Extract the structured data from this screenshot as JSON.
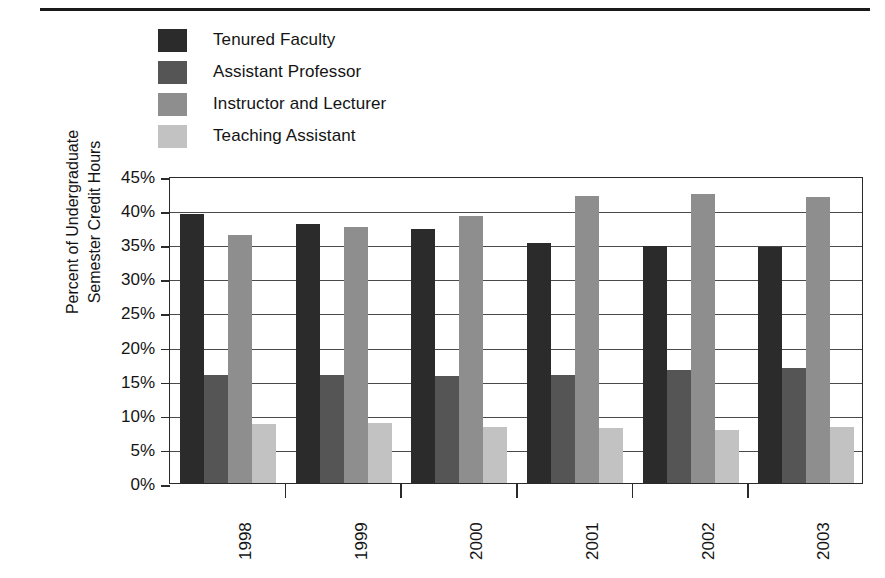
{
  "chart_data": {
    "type": "bar",
    "title": "",
    "xlabel": "",
    "ylabel": "Percent of Undergraduate Semester Credit Hours",
    "ylabel_line1": "Percent of Undergraduate",
    "ylabel_line2": "Semester Credit Hours",
    "categories": [
      "1998",
      "1999",
      "2000",
      "2001",
      "2002",
      "2003"
    ],
    "ylim": [
      0,
      45
    ],
    "ytick_labels": [
      "45%",
      "40%",
      "35%",
      "30%",
      "25%",
      "20%",
      "15%",
      "10%",
      "5%",
      "0%"
    ],
    "ytick_values": [
      45,
      40,
      35,
      30,
      25,
      20,
      15,
      10,
      5,
      0
    ],
    "grid": true,
    "legend_position": "top-left",
    "series": [
      {
        "name": "Tenured Faculty",
        "color": "#2b2b2b",
        "values": [
          39.4,
          37.9,
          37.3,
          35.2,
          34.7,
          34.6
        ]
      },
      {
        "name": "Assistant Professor",
        "color": "#555555",
        "values": [
          15.9,
          15.9,
          15.7,
          15.8,
          16.5,
          16.8
        ]
      },
      {
        "name": "Instructor and Lecturer",
        "color": "#8e8e8e",
        "values": [
          36.4,
          37.6,
          39.2,
          42.1,
          42.4,
          41.9
        ]
      },
      {
        "name": "Teaching Assistant",
        "color": "#c2c2c2",
        "values": [
          8.7,
          8.8,
          8.2,
          8.0,
          7.8,
          8.2
        ]
      }
    ]
  },
  "legend": {
    "items": [
      {
        "label": "Tenured Faculty",
        "color": "#2b2b2b"
      },
      {
        "label": "Assistant Professor",
        "color": "#555555"
      },
      {
        "label": "Instructor and Lecturer",
        "color": "#8e8e8e"
      },
      {
        "label": "Teaching Assistant",
        "color": "#c2c2c2"
      }
    ]
  },
  "style": {
    "axis_color": "#2a2a2a",
    "grid_color": "#4a4a4a",
    "text_color": "#141414",
    "background": "#ffffff",
    "rule_color": "#1a1a1a"
  }
}
